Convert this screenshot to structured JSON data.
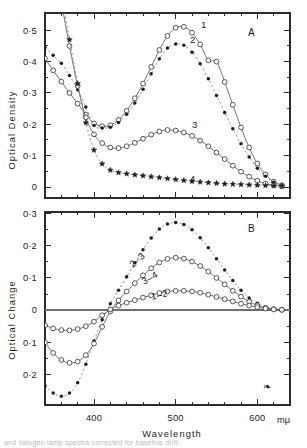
{
  "figure": {
    "background_color": "#ffffff",
    "ink_color": "#1f1f1f",
    "caption_fragment": "and halogen lamp spectra corrected for baseline drift"
  },
  "axes": {
    "x_title": "Wavelength",
    "x_unit": "mμ",
    "x_tick_labels": [
      "400",
      "500",
      "600"
    ],
    "x_tick_values": [
      400,
      500,
      600
    ],
    "x_min": 340,
    "x_max": 640,
    "x_minor_step": 20
  },
  "panel_a": {
    "panel_label": "A",
    "y_title": "Optical  Density",
    "y_tick_labels": [
      "0·5",
      "0·4",
      "0·3",
      "0·2",
      "0·1",
      "0"
    ],
    "y_tick_values": [
      0.5,
      0.4,
      0.3,
      0.2,
      0.1,
      0
    ],
    "y_min": -0.035,
    "y_max": 0.555,
    "curve_labels": [
      "1",
      "2",
      "3",
      "4"
    ]
  },
  "panel_b": {
    "panel_label": "B",
    "y_title": "Optical  Change",
    "y_tick_labels": [
      "0·3",
      "0·2",
      "0·1",
      "0",
      "0·1",
      "0·2"
    ],
    "y_tick_values": [
      0.3,
      0.2,
      0.1,
      0,
      -0.1,
      -0.2
    ],
    "y_min": -0.295,
    "y_max": 0.305,
    "curve_labels": [
      "2–3",
      "3–4",
      "1–2"
    ],
    "corner_mark": "❧"
  },
  "chart_data": [
    {
      "type": "line",
      "title": "A",
      "xlabel": "Wavelength",
      "ylabel": "Optical Density",
      "xlim": [
        340,
        640
      ],
      "ylim": [
        -0.035,
        0.555
      ],
      "grid": false,
      "legend_position": "inline-curve-labels",
      "x": [
        340,
        350,
        360,
        370,
        380,
        390,
        400,
        410,
        420,
        430,
        440,
        450,
        460,
        470,
        480,
        490,
        500,
        510,
        520,
        530,
        540,
        550,
        560,
        570,
        580,
        590,
        600,
        610,
        620,
        630
      ],
      "series": [
        {
          "name": "1",
          "marker": "open-circle",
          "line": "solid",
          "values": [
            0.41,
            0.372,
            0.336,
            0.3,
            0.266,
            0.231,
            0.203,
            0.194,
            0.197,
            0.214,
            0.243,
            0.283,
            0.33,
            0.383,
            0.437,
            0.482,
            0.508,
            0.511,
            0.492,
            0.455,
            0.404,
            0.4,
            0.335,
            0.262,
            0.19,
            0.126,
            0.075,
            0.04,
            0.017,
            0.006
          ]
        },
        {
          "name": "2",
          "marker": "filled-circle",
          "line": "dashed",
          "values": [
            0.445,
            0.42,
            0.395,
            0.356,
            0.31,
            0.255,
            0.196,
            0.188,
            0.191,
            0.206,
            0.232,
            0.268,
            0.312,
            0.361,
            0.409,
            0.443,
            0.456,
            0.452,
            0.43,
            0.393,
            0.345,
            0.292,
            0.238,
            0.186,
            0.138,
            0.096,
            0.06,
            0.034,
            0.015,
            0.005
          ]
        },
        {
          "name": "3",
          "marker": "open-circle",
          "line": "solid",
          "values": [
            0.885,
            0.735,
            0.59,
            0.45,
            0.322,
            0.222,
            0.168,
            0.14,
            0.126,
            0.124,
            0.13,
            0.141,
            0.154,
            0.167,
            0.177,
            0.182,
            0.18,
            0.174,
            0.163,
            0.148,
            0.13,
            0.11,
            0.089,
            0.068,
            0.049,
            0.033,
            0.02,
            0.011,
            0.005,
            0.002
          ]
        },
        {
          "name": "4",
          "marker": "filled-star",
          "line": "dashed",
          "values": [
            0.905,
            0.76,
            0.615,
            0.47,
            0.33,
            0.205,
            0.118,
            0.074,
            0.054,
            0.046,
            0.042,
            0.039,
            0.036,
            0.033,
            0.03,
            0.027,
            0.024,
            0.021,
            0.018,
            0.016,
            0.014,
            0.012,
            0.01,
            0.009,
            0.008,
            0.007,
            0.006,
            0.005,
            0.004,
            0.003
          ]
        }
      ]
    },
    {
      "type": "line",
      "title": "B",
      "xlabel": "Wavelength",
      "ylabel": "Optical Change",
      "xlim": [
        340,
        640
      ],
      "ylim": [
        -0.295,
        0.305
      ],
      "grid": false,
      "legend_position": "inline-curve-labels",
      "zero_reference_line": 0,
      "x": [
        340,
        350,
        360,
        370,
        380,
        390,
        400,
        410,
        420,
        430,
        440,
        450,
        460,
        470,
        480,
        490,
        500,
        510,
        520,
        530,
        540,
        550,
        560,
        570,
        580,
        590,
        600,
        610,
        620,
        630
      ],
      "series": [
        {
          "name": "2–3",
          "marker": "filled-circle",
          "line": "dashed",
          "values": [
            -0.235,
            -0.258,
            -0.268,
            -0.258,
            -0.226,
            -0.168,
            -0.096,
            -0.03,
            0.02,
            0.062,
            0.104,
            0.147,
            0.188,
            0.224,
            0.252,
            0.268,
            0.272,
            0.266,
            0.25,
            0.225,
            0.194,
            0.16,
            0.125,
            0.092,
            0.062,
            0.038,
            0.021,
            0.01,
            0.004,
            0.001
          ]
        },
        {
          "name": "3–4",
          "marker": "open-circle",
          "line": "solid",
          "values": [
            -0.1,
            -0.133,
            -0.155,
            -0.164,
            -0.16,
            -0.14,
            -0.104,
            -0.052,
            -0.004,
            0.03,
            0.058,
            0.084,
            0.108,
            0.13,
            0.148,
            0.159,
            0.163,
            0.16,
            0.151,
            0.137,
            0.12,
            0.1,
            0.08,
            0.06,
            0.042,
            0.026,
            0.015,
            0.007,
            0.003,
            0.001
          ]
        },
        {
          "name": "1–2",
          "marker": "open-circle",
          "line": "solid",
          "values": [
            -0.047,
            -0.057,
            -0.062,
            -0.063,
            -0.059,
            -0.05,
            -0.036,
            -0.016,
            0.002,
            0.014,
            0.023,
            0.031,
            0.039,
            0.046,
            0.053,
            0.058,
            0.06,
            0.06,
            0.058,
            0.054,
            0.048,
            0.041,
            0.034,
            0.027,
            0.02,
            0.014,
            0.009,
            0.005,
            0.002,
            0.001
          ]
        }
      ]
    }
  ]
}
